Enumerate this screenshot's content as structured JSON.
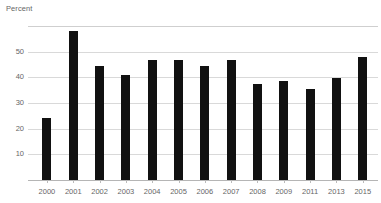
{
  "chart_data": {
    "type": "bar",
    "title": "",
    "subtitle": "",
    "ylabel": "Percent",
    "xlabel": "",
    "categories": [
      "2000",
      "2001",
      "2002",
      "2003",
      "2004",
      "2005",
      "2006",
      "2007",
      "2008",
      "2009",
      "2011",
      "2013",
      "2015"
    ],
    "values": [
      24,
      58,
      44.5,
      41,
      46.5,
      46.5,
      44.5,
      46.5,
      37.5,
      38.5,
      35.5,
      39.5,
      48
    ],
    "ylim": [
      0,
      60
    ],
    "yticks": [
      10,
      20,
      30,
      40,
      50
    ],
    "ytick_labels": [
      "10",
      "20",
      "30",
      "40",
      "50"
    ],
    "grid": true,
    "grid_axis": "y",
    "legend": null,
    "bar_color": "#111111",
    "grid_color": "#d9d9d9",
    "text_color": "#666666",
    "background_color": "#ffffff"
  }
}
